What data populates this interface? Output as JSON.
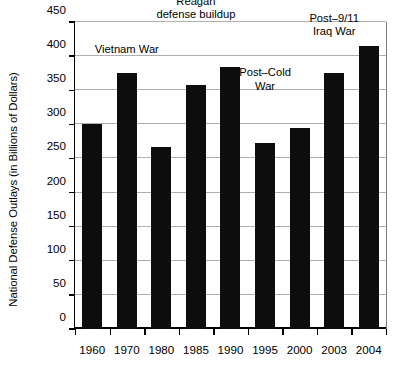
{
  "chart_data": {
    "type": "bar",
    "title": "",
    "subtitle": "",
    "xlabel": "",
    "ylabel": "National Defense Outlays (in Billions of Dollars)",
    "categories": [
      "1960",
      "1970",
      "1980",
      "1985",
      "1990",
      "1995",
      "2000",
      "2003",
      "2004"
    ],
    "values": [
      300,
      376,
      267,
      357,
      384,
      272,
      294,
      375,
      415
    ],
    "series": [
      {
        "name": "National Defense Outlays",
        "values": [
          300,
          376,
          267,
          357,
          384,
          272,
          294,
          375,
          415
        ]
      }
    ],
    "ylim": [
      0,
      450
    ],
    "ytick_labels": [
      "0",
      "50",
      "100",
      "150",
      "200",
      "250",
      "300",
      "350",
      "400",
      "450"
    ],
    "ytick_values": [
      0,
      50,
      100,
      150,
      200,
      250,
      300,
      350,
      400,
      450
    ],
    "grid": "horizontal",
    "legend": "none",
    "bar_color": "#0d0d0d",
    "gridline_color": "#b0b0b0",
    "axis_color": "#000000",
    "background_color": "#ffffff",
    "annotations": [
      {
        "id": "vietnam-war",
        "text_lines": [
          "Vietnam War"
        ],
        "anchor_category": "1970",
        "anchor_value": 400
      },
      {
        "id": "reagan-defense-buildup",
        "text_lines": [
          "Reagan",
          "defense buildup"
        ],
        "anchor_category": "1985",
        "anchor_value": 450
      },
      {
        "id": "post-cold-war",
        "text_lines": [
          "Post–Cold",
          "War"
        ],
        "anchor_category": "1995",
        "anchor_value": 345
      },
      {
        "id": "post-911-iraq-war",
        "text_lines": [
          "Post–9/11",
          "Iraq War"
        ],
        "anchor_category": "2003",
        "anchor_value": 425
      }
    ]
  }
}
